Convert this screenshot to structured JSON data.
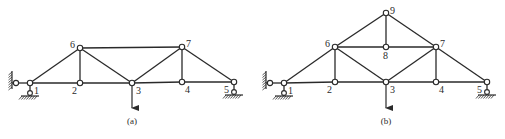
{
  "figures": [
    {
      "id": "a",
      "caption": "(a)",
      "caption_pos": [
        132,
        124
      ],
      "nodes": [
        {
          "id": "1",
          "label": "1",
          "x": 30,
          "y": 83,
          "lx": 34,
          "ly": 94
        },
        {
          "id": "2",
          "label": "2",
          "x": 80,
          "y": 83,
          "lx": 72,
          "ly": 94
        },
        {
          "id": "3",
          "label": "3",
          "x": 132,
          "y": 83,
          "lx": 136,
          "ly": 94
        },
        {
          "id": "4",
          "label": "4",
          "x": 182,
          "y": 82,
          "lx": 185,
          "ly": 93
        },
        {
          "id": "5",
          "label": "5",
          "x": 234,
          "y": 82,
          "lx": 224,
          "ly": 93
        },
        {
          "id": "6",
          "label": "6",
          "x": 80,
          "y": 48,
          "lx": 70,
          "ly": 48
        },
        {
          "id": "7",
          "label": "7",
          "x": 182,
          "y": 47,
          "lx": 186,
          "ly": 47
        }
      ],
      "members": [
        [
          "1",
          "2"
        ],
        [
          "2",
          "3"
        ],
        [
          "3",
          "4"
        ],
        [
          "4",
          "5"
        ],
        [
          "1",
          "6"
        ],
        [
          "6",
          "2"
        ],
        [
          "6",
          "3"
        ],
        [
          "6",
          "7"
        ],
        [
          "3",
          "7"
        ],
        [
          "7",
          "4"
        ],
        [
          "7",
          "5"
        ]
      ],
      "supports": {
        "pin_wall": {
          "node": "1",
          "wall_x": 12
        },
        "roller_left": {
          "node": "1"
        },
        "roller_right": {
          "node": "5"
        }
      },
      "load": {
        "node": "3",
        "from_y": 86,
        "to_y": 108,
        "direction": "down"
      }
    },
    {
      "id": "b",
      "caption": "(b)",
      "caption_pos": [
        386,
        124
      ],
      "nodes": [
        {
          "id": "1",
          "label": "1",
          "x": 284,
          "y": 83,
          "lx": 288,
          "ly": 94
        },
        {
          "id": "2",
          "label": "2",
          "x": 335,
          "y": 82,
          "lx": 327,
          "ly": 93
        },
        {
          "id": "3",
          "label": "3",
          "x": 386,
          "y": 82,
          "lx": 390,
          "ly": 93
        },
        {
          "id": "4",
          "label": "4",
          "x": 436,
          "y": 82,
          "lx": 439,
          "ly": 93
        },
        {
          "id": "5",
          "label": "5",
          "x": 487,
          "y": 82,
          "lx": 477,
          "ly": 93
        },
        {
          "id": "6",
          "label": "6",
          "x": 335,
          "y": 47,
          "lx": 325,
          "ly": 47
        },
        {
          "id": "7",
          "label": "7",
          "x": 436,
          "y": 47,
          "lx": 440,
          "ly": 47
        },
        {
          "id": "8",
          "label": "8",
          "x": 386,
          "y": 47,
          "lx": 383,
          "ly": 59
        },
        {
          "id": "9",
          "label": "9",
          "x": 386,
          "y": 13,
          "lx": 390,
          "ly": 14
        }
      ],
      "members": [
        [
          "1",
          "2"
        ],
        [
          "2",
          "3"
        ],
        [
          "3",
          "4"
        ],
        [
          "4",
          "5"
        ],
        [
          "1",
          "6"
        ],
        [
          "6",
          "2"
        ],
        [
          "6",
          "3"
        ],
        [
          "6",
          "8"
        ],
        [
          "8",
          "7"
        ],
        [
          "3",
          "7"
        ],
        [
          "7",
          "4"
        ],
        [
          "7",
          "5"
        ],
        [
          "6",
          "9"
        ],
        [
          "9",
          "7"
        ],
        [
          "9",
          "8"
        ]
      ],
      "supports": {
        "pin_wall": {
          "node": "1",
          "wall_x": 266
        },
        "roller_left": {
          "node": "1"
        },
        "roller_right": {
          "node": "5"
        }
      },
      "load": {
        "node": "3",
        "from_y": 85,
        "to_y": 108,
        "direction": "down"
      }
    }
  ]
}
